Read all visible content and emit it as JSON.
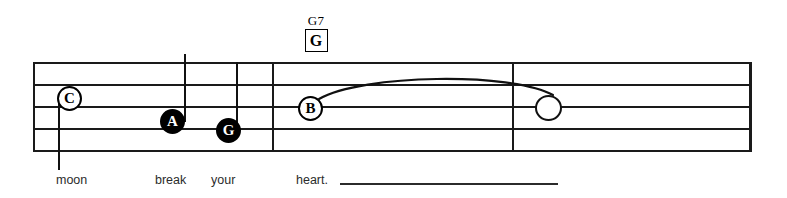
{
  "score": {
    "chord": {
      "name": "G7",
      "diagram_letter": "G"
    },
    "staff": {
      "line_count": 5
    },
    "notes": [
      {
        "letter": "C",
        "style": "hollow",
        "stem": "down"
      },
      {
        "letter": "A",
        "style": "filled",
        "stem": "up"
      },
      {
        "letter": "G",
        "style": "filled",
        "stem": "up"
      },
      {
        "letter": "B",
        "style": "hollow",
        "stem": "none"
      },
      {
        "letter": "",
        "style": "blank",
        "stem": "none"
      }
    ],
    "lyrics": [
      {
        "text": "moon"
      },
      {
        "text": "break"
      },
      {
        "text": "your"
      },
      {
        "text": "heart."
      }
    ],
    "colors": {
      "ink": "#1a1a1a",
      "lyric": "#2b2b2b",
      "paper": "#ffffff"
    }
  }
}
